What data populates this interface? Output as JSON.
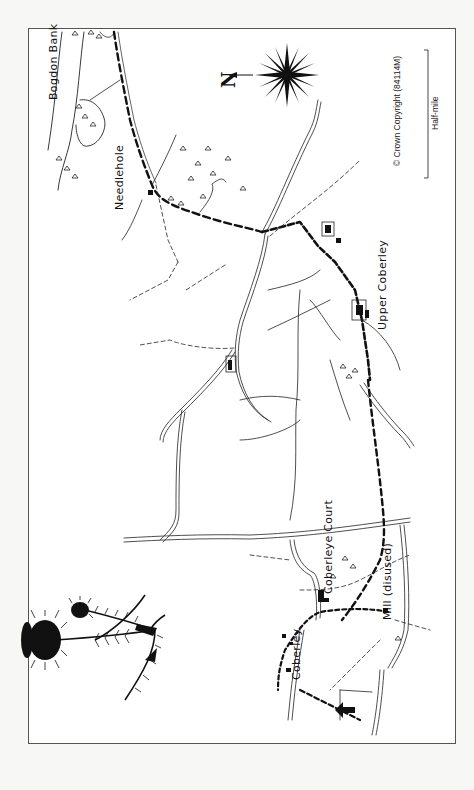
{
  "map": {
    "orientation": "rotated 90° — north points to image left",
    "north_label": "N",
    "copyright": "© Crown Copyright (84114M)",
    "scale_bar": {
      "label": "Half-mile"
    },
    "places": [
      {
        "id": "bogdon-bank",
        "label": "Bogdon Bank"
      },
      {
        "id": "needlehole",
        "label": "Needlehole"
      },
      {
        "id": "upper-coberley",
        "label": "Upper Coberley"
      },
      {
        "id": "coberley-court",
        "label": "Coberleye Court"
      },
      {
        "id": "mill",
        "label": "Mill (disused)"
      },
      {
        "id": "coberley",
        "label": "Coberley"
      }
    ],
    "legend": {
      "route": "heavy dashed line",
      "footpath": "thin dashed line",
      "road": "double line",
      "boundary": "thin solid line"
    },
    "decoration": "thistle illustration",
    "colors": {
      "ink": "#111111",
      "frame": "#555555",
      "paper": "#ffffff",
      "background": "#f7f7f5"
    }
  }
}
